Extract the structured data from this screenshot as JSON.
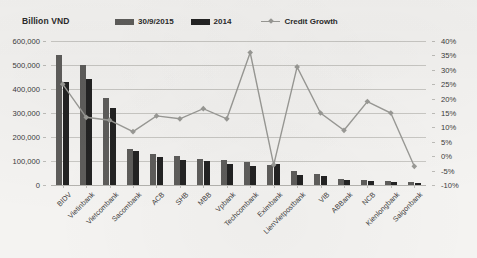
{
  "chart_data": {
    "type": "bar",
    "title": "",
    "ylabel": "Billion VND",
    "xlabel": "",
    "ylim": [
      0,
      600000
    ],
    "y2lim": [
      -10,
      40
    ],
    "grid": true,
    "legend_position": "top",
    "categories": [
      "BIDV",
      "Vietinbank",
      "Vietcombank",
      "Sacombank",
      "ACB",
      "SHB",
      "MBB",
      "Vpbank",
      "Techcombank",
      "Eximbank",
      "LienVietpostbank",
      "VIB",
      "ABBank",
      "NCB",
      "Kienlongbank",
      "Saigonbank"
    ],
    "series": [
      {
        "name": "30/9/2015",
        "type": "bar",
        "color": "#5e5d5b",
        "axis": "left",
        "values": [
          542000,
          500000,
          362000,
          152000,
          131000,
          120000,
          110000,
          105000,
          97000,
          83000,
          60000,
          46000,
          24000,
          19000,
          16000,
          11000
        ]
      },
      {
        "name": "2014",
        "type": "bar",
        "color": "#232323",
        "axis": "left",
        "values": [
          430000,
          440000,
          322000,
          140000,
          118000,
          104000,
          100000,
          89000,
          81000,
          86000,
          42000,
          39000,
          21000,
          16000,
          14000,
          10000
        ]
      },
      {
        "name": "Credit Growth",
        "type": "line",
        "color": "#9a9a96",
        "axis": "right",
        "values": [
          25.0,
          13.5,
          12.5,
          8.5,
          14.0,
          13.0,
          16.5,
          13.0,
          36.0,
          -3.0,
          31.0,
          15.0,
          9.0,
          19.0,
          15.0,
          -3.5
        ]
      }
    ],
    "y_ticks": [
      "600,000",
      "500,000",
      "400,000",
      "300,000",
      "200,000",
      "100,000",
      "0"
    ],
    "y2_ticks": [
      "40%",
      "35%",
      "30%",
      "25%",
      "20%",
      "15%",
      "10%",
      "5%",
      "0%",
      "-5%",
      "-10%"
    ]
  },
  "legend": {
    "items": [
      {
        "label": "30/9/2015",
        "marker": "bar-swatch"
      },
      {
        "label": "2014",
        "marker": "bar-swatch"
      },
      {
        "label": "Credit Growth",
        "marker": "line-marker"
      }
    ]
  },
  "colors": {
    "series_1": "#5e5d5b",
    "series_2": "#232323",
    "line": "#9a9a96",
    "grid": "#c9c8c4",
    "background": "#f4f3f1",
    "text": "#2b2b2b"
  }
}
